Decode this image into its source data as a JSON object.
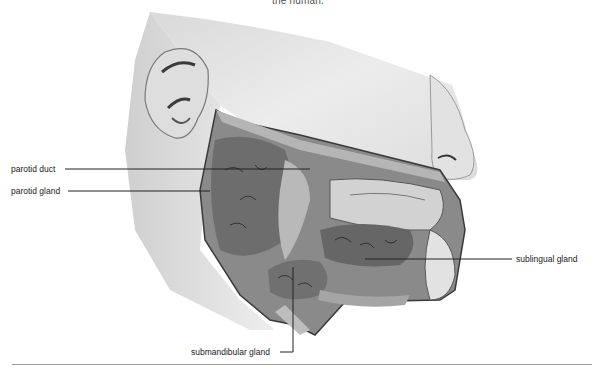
{
  "caption_top": "the human.",
  "figure": {
    "labels": [
      {
        "id": "parotid-duct",
        "text": "parotid duct"
      },
      {
        "id": "parotid-gland",
        "text": "parotid gland"
      },
      {
        "id": "sublingual-gland",
        "text": "sublingual gland"
      },
      {
        "id": "submandibular-gland",
        "text": "submandibular gland"
      }
    ]
  },
  "colors": {
    "skin": "#e6e6e6",
    "skin_shadow": "#c8c8c8",
    "gland": "#6f6f6f",
    "cavity": "#9c9c9c",
    "leader_line": "#222222"
  }
}
